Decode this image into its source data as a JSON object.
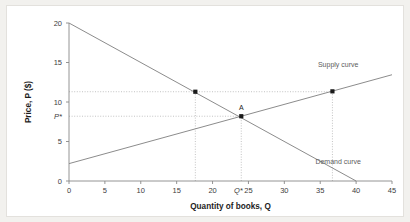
{
  "figure": {
    "background_color": "#ffffff",
    "outer_color": "#f2f1ee",
    "border_color": "#e3e1dd"
  },
  "chart_data": {
    "type": "line",
    "title": "",
    "subtitle": "",
    "xlabel": "Quantity of books, Q",
    "ylabel": "Price, P ($)",
    "xlim": [
      0,
      45
    ],
    "ylim": [
      0,
      20
    ],
    "xticks": [
      0,
      5,
      10,
      15,
      20,
      25,
      30,
      35,
      40,
      45
    ],
    "xtick_labels": [
      "0",
      "5",
      "10",
      "15",
      "20",
      "25",
      "30",
      "35",
      "40",
      "45"
    ],
    "yticks": [
      0,
      5,
      10,
      15,
      20
    ],
    "ytick_labels": [
      "0",
      "5",
      "10",
      "15",
      "20"
    ],
    "grid": false,
    "legend_position": "inline-annotations",
    "line_color": "#8c8c8c",
    "marker_color": "#1a1a1a",
    "guide_color": "#b4b4b4",
    "series": [
      {
        "name": "Demand curve",
        "label": "Demand curve",
        "label_x": 37.5,
        "label_y": 2.15,
        "x": [
          0,
          40
        ],
        "y": [
          20,
          0
        ],
        "intercept": 20,
        "slope": -0.5
      },
      {
        "name": "Supply curve",
        "label": "Supply curve",
        "label_x": 37.5,
        "label_y": 14.4,
        "x": [
          0,
          45
        ],
        "y": [
          2.2,
          13.45
        ],
        "intercept": 2.2,
        "slope": 0.25
      }
    ],
    "points": [
      {
        "name": "demand-point",
        "label": "",
        "x": 17.6,
        "y": 11.3
      },
      {
        "name": "equilibrium-point-A",
        "label": "A",
        "x": 24.0,
        "y": 8.2
      },
      {
        "name": "supply-point",
        "label": "",
        "x": 36.7,
        "y": 11.35
      }
    ],
    "annotations": [
      {
        "name": "equilibrium-price-label",
        "text": "P*",
        "axis": "y",
        "value": 8.2
      },
      {
        "name": "equilibrium-quantity-label",
        "text": "Q*",
        "axis": "x",
        "value": 24.0
      }
    ],
    "guide_lines": [
      {
        "name": "price-high-horizontal",
        "type": "horizontal",
        "y": 11.3,
        "x_from": 0,
        "x_to": 36.7
      },
      {
        "name": "demand-point-vertical",
        "type": "vertical",
        "x": 17.6,
        "y_from": 0,
        "y_to": 11.3
      },
      {
        "name": "supply-point-vertical",
        "type": "vertical",
        "x": 36.7,
        "y_from": 0,
        "y_to": 11.35
      },
      {
        "name": "equilibrium-price-horizontal",
        "type": "horizontal",
        "y": 8.2,
        "x_from": 0,
        "x_to": 24.0
      },
      {
        "name": "equilibrium-quantity-vertical",
        "type": "vertical",
        "x": 24.0,
        "y_from": 0,
        "y_to": 8.2
      }
    ]
  }
}
